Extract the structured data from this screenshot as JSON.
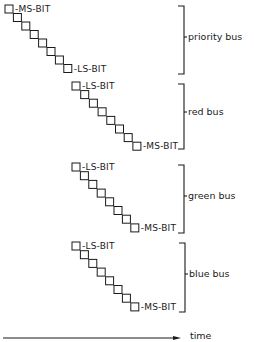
{
  "diagram": {
    "colors": {
      "ink": "#1a1a1a",
      "background": "#ffffff"
    },
    "square_size": 8,
    "buses": [
      {
        "name": "priority bus",
        "bit_count": 8,
        "start": [
          5,
          5
        ],
        "step": [
          8.4,
          8.5
        ],
        "top_label": "-MS-BIT",
        "bottom_label": "-LS-BIT",
        "bracket": {
          "x": 184,
          "top": 6,
          "bottom": 74,
          "label_y": 40
        }
      },
      {
        "name": "red bus",
        "bit_count": 8,
        "start": [
          72,
          82
        ],
        "step": [
          8.7,
          8.6
        ],
        "top_label": "-LS-BIT",
        "bottom_label": "-MS-BIT",
        "bracket": {
          "x": 184,
          "top": 84,
          "bottom": 149,
          "label_y": 115
        }
      },
      {
        "name": "green bus",
        "bit_count": 8,
        "start": [
          72,
          163
        ],
        "step": [
          8.4,
          8.7
        ],
        "top_label": "-LS-BIT",
        "bottom_label": "-MS-BIT",
        "bracket": {
          "x": 184,
          "top": 165,
          "bottom": 233,
          "label_y": 199
        }
      },
      {
        "name": "blue bus",
        "bit_count": 8,
        "start": [
          72,
          242
        ],
        "step": [
          8.4,
          8.7
        ],
        "top_label": "-LS-BIT",
        "bottom_label": "-MS-BIT",
        "bracket": {
          "x": 185,
          "top": 243,
          "bottom": 312,
          "label_y": 277
        }
      }
    ],
    "time_axis": {
      "label": "time",
      "x1": 3,
      "x2": 181,
      "y": 338,
      "label_x": 190,
      "label_y": 339
    }
  }
}
